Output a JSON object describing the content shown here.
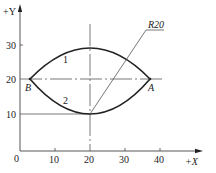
{
  "diagram": {
    "type": "cnc-arc-programming-figure",
    "axes": {
      "x_label": "+X",
      "y_label": "+Y",
      "origin_label": "0",
      "x_ticks": [
        "10",
        "20",
        "30",
        "40"
      ],
      "y_ticks": [
        "10",
        "20",
        "30"
      ]
    },
    "points": {
      "A": "A",
      "B": "B"
    },
    "arcs": [
      {
        "id": "arc-1",
        "label": "1",
        "from": "B",
        "to": "A",
        "side": "upper"
      },
      {
        "id": "arc-2",
        "label": "2",
        "from": "B",
        "to": "A",
        "side": "lower"
      }
    ],
    "radius_label": "R20",
    "colors": {
      "line": "#222222",
      "thin_line": "#555555",
      "background": "#ffffff"
    }
  }
}
